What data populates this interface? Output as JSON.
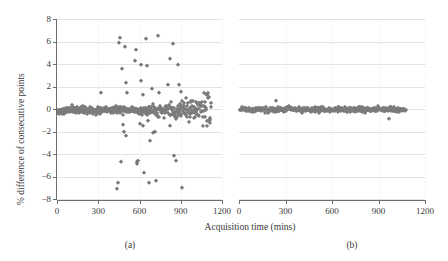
{
  "figure": {
    "xlabel": "Acquisition time (mins)",
    "ylabel": "% difference of consecutive points",
    "panel_a_caption": "(a)",
    "panel_b_caption": "(b)",
    "marker_color": "#767676",
    "gridline_color": "#e2e2e2",
    "axis_color": "#6e6e6e"
  },
  "axes": {
    "xticks": [
      0,
      300,
      600,
      900,
      1200
    ],
    "xtick_labels": [
      "0",
      "300",
      "600",
      "900",
      "1200"
    ],
    "yticks": [
      -8,
      -6,
      -4,
      -2,
      0,
      2,
      4,
      6,
      8
    ],
    "ytick_labels": [
      "−8",
      "−6",
      "−4",
      "−2",
      "0",
      "2",
      "4",
      "6",
      "8"
    ],
    "xlim": [
      0,
      1200
    ],
    "ylim": [
      -8,
      8
    ],
    "grid": "horizontal solid light-gray, vertical dotted light-gray"
  },
  "chart_data": [
    {
      "type": "scatter",
      "panel": "(a)",
      "title": "",
      "xlabel": "Acquisition time (mins)",
      "ylabel": "% difference of consecutive points",
      "xlim": [
        0,
        1200
      ],
      "ylim": [
        -8,
        8
      ],
      "xticks": [
        0,
        300,
        600,
        900,
        1200
      ],
      "yticks": [
        -8,
        -6,
        -4,
        -2,
        0,
        2,
        4,
        6,
        8
      ],
      "marker": "diamond",
      "color": "#767676",
      "legend": "none",
      "series": [
        {
          "name": "outliers",
          "points": [
            [
              435,
              -7.1
            ],
            [
              441,
              -6.55
            ],
            [
              452,
              5.9
            ],
            [
              458,
              6.3
            ],
            [
              462,
              -4.7
            ],
            [
              470,
              3.6
            ],
            [
              478,
              -1.45
            ],
            [
              484,
              -2.05
            ],
            [
              492,
              5.5
            ],
            [
              498,
              -2.4
            ],
            [
              500,
              2.35
            ],
            [
              512,
              1.4
            ],
            [
              566,
              4.25
            ],
            [
              572,
              5.25
            ],
            [
              578,
              -4.75
            ],
            [
              585,
              -4.85
            ],
            [
              592,
              -4.6
            ],
            [
              600,
              -1.35
            ],
            [
              608,
              2.5
            ],
            [
              614,
              3.9
            ],
            [
              622,
              1.25
            ],
            [
              628,
              -1.5
            ],
            [
              635,
              -5.65
            ],
            [
              645,
              6.2
            ],
            [
              652,
              3.85
            ],
            [
              660,
              -1.05
            ],
            [
              668,
              -6.6
            ],
            [
              676,
              -2.85
            ],
            [
              690,
              1.8
            ],
            [
              700,
              -2.15
            ],
            [
              712,
              -2.05
            ],
            [
              722,
              -6.4
            ],
            [
              736,
              6.5
            ],
            [
              740,
              1.45
            ],
            [
              808,
              2.1
            ],
            [
              818,
              4.45
            ],
            [
              822,
              -1.5
            ],
            [
              840,
              5.8
            ],
            [
              852,
              -4.15
            ],
            [
              866,
              -4.6
            ],
            [
              880,
              3.95
            ],
            [
              890,
              2.15
            ],
            [
              900,
              1.55
            ],
            [
              910,
              -7.0
            ],
            [
              318,
              1.4
            ],
            [
              348,
              -0.15
            ]
          ]
        },
        {
          "name": "main band",
          "y_center": -0.1,
          "y_spread": 0.45,
          "x_range": [
            5,
            1120
          ],
          "n_points": 430,
          "description": "dense near-zero band broadening after 600 mins, rising tail to +1.5 and dipping to -1.5 near 1100"
        }
      ]
    },
    {
      "type": "scatter",
      "panel": "(b)",
      "title": "",
      "xlabel": "Acquisition time (mins)",
      "ylabel": "",
      "xlim": [
        0,
        1200
      ],
      "ylim": [
        -8,
        8
      ],
      "xticks": [
        0,
        300,
        600,
        900,
        1200
      ],
      "yticks": [
        -8,
        -6,
        -4,
        -2,
        0,
        2,
        4,
        6,
        8
      ],
      "marker": "diamond",
      "color": "#767676",
      "legend": "none",
      "series": [
        {
          "name": "main band",
          "y_center": -0.05,
          "y_spread": 0.3,
          "x_range": [
            5,
            1075
          ],
          "n_points": 400,
          "description": "tight near-zero band across full acquisition, no large outliers"
        },
        {
          "name": "minor outliers",
          "points": [
            [
              240,
              0.75
            ],
            [
              965,
              -0.85
            ]
          ]
        }
      ]
    }
  ]
}
